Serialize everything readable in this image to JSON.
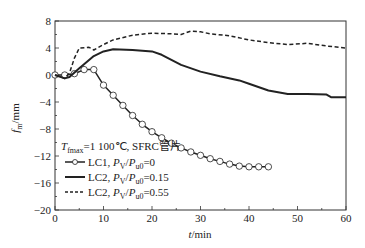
{
  "chart_data": {
    "type": "line",
    "title": "",
    "xlabel": "t/min",
    "ylabel": "f_m/mm",
    "xlim": [
      0,
      60
    ],
    "ylim": [
      -20,
      8
    ],
    "xticks": [
      0,
      10,
      20,
      30,
      40,
      50,
      60
    ],
    "yticks": [
      8,
      4,
      0,
      -4,
      -8,
      -12,
      -16,
      -20
    ],
    "grid": false,
    "legend_position": "lower-left inside",
    "legend_title": "T_fmax=1 100℃, SFRC管片",
    "series": [
      {
        "name": "LC1, Pv/Pu0=0",
        "style": "solid-circle-markers",
        "x": [
          0,
          2,
          4,
          6,
          8,
          10,
          12,
          14,
          16,
          18,
          20,
          22,
          24,
          26,
          28,
          30,
          32,
          34,
          36,
          38,
          40,
          42,
          44
        ],
        "y": [
          0,
          0,
          0.2,
          0.8,
          0.8,
          -1.5,
          -3.0,
          -4.5,
          -6.0,
          -7.3,
          -8.4,
          -9.3,
          -10.1,
          -10.8,
          -11.4,
          -11.9,
          -12.4,
          -12.8,
          -13.2,
          -13.5,
          -13.6,
          -13.6,
          -13.6
        ]
      },
      {
        "name": "LC2, Pv/Pu0=0.15",
        "style": "solid",
        "x": [
          0,
          2,
          3,
          5,
          8,
          10,
          12,
          16,
          20,
          22,
          26,
          30,
          34,
          38,
          40,
          44,
          48,
          52,
          56,
          57,
          60
        ],
        "y": [
          0,
          -0.5,
          -0.3,
          1.0,
          2.8,
          3.5,
          3.8,
          3.7,
          3.5,
          3.0,
          1.5,
          0.5,
          -0.2,
          -0.8,
          -1.3,
          -2.3,
          -2.8,
          -2.8,
          -2.9,
          -3.3,
          -3.3
        ]
      },
      {
        "name": "LC2, Pv/Pu0=0.55",
        "style": "dashed",
        "x": [
          0,
          2,
          3,
          4,
          5,
          7,
          8,
          10,
          12,
          16,
          20,
          24,
          26,
          28,
          30,
          32,
          36,
          40,
          44,
          48,
          52,
          56,
          60
        ],
        "y": [
          0,
          -0.5,
          0.3,
          2.5,
          4.0,
          4.1,
          3.7,
          4.5,
          5.2,
          5.9,
          6.2,
          6.1,
          6.0,
          6.5,
          6.4,
          6.1,
          5.8,
          5.2,
          4.8,
          4.5,
          4.7,
          4.3,
          4.0
        ]
      }
    ]
  },
  "axis": {
    "x_label_italic": "t",
    "x_label_unit": "/min",
    "y_label_italic": "f",
    "y_label_sub": "m",
    "y_label_unit": "/mm"
  },
  "legend": {
    "title_T": "T",
    "title_sub": "fmax",
    "title_rest": "=1 100℃, SFRC管片",
    "entries": [
      {
        "prefix": "LC1, ",
        "P": "P",
        "psub": "V",
        "slash": "/",
        "P2": "P",
        "p2sub": "u0",
        "value": "=0"
      },
      {
        "prefix": "LC2, ",
        "P": "P",
        "psub": "V",
        "slash": "/",
        "P2": "P",
        "p2sub": "u0",
        "value": "=0.15"
      },
      {
        "prefix": "LC2, ",
        "P": "P",
        "psub": "V",
        "slash": "/",
        "P2": "P",
        "p2sub": "u0",
        "value": "=0.55"
      }
    ]
  }
}
